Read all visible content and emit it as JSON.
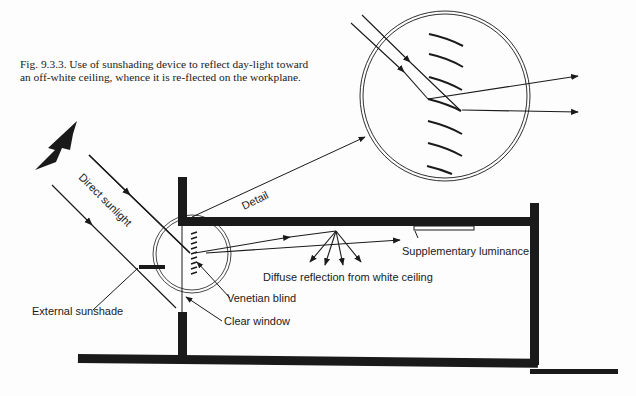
{
  "caption": "Fig. 9.3.3. Use of sunshading device to reflect day-light toward an off-white ceiling, whence it is re-flected on the workplane.",
  "labels": {
    "direct_sunlight": "Direct sunlight",
    "detail": "Detail",
    "supplementary_luminance": "Supplementary luminance",
    "diffuse_reflection": "Diffuse reflection from white ceiling",
    "venetian_blind": "Venetian blind",
    "external_sunshade": "External sunshade",
    "clear_window": "Clear window"
  },
  "colors": {
    "ink": "#1a1a1a",
    "paper": "#fdfdfd"
  }
}
